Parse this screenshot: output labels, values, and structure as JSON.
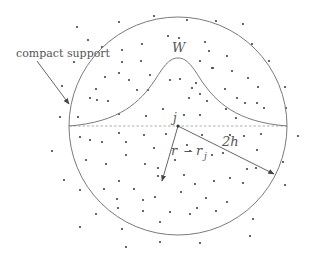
{
  "figure": {
    "width": 310,
    "height": 263,
    "colors": {
      "background": "#ffffff",
      "circle": "#7a7a7a",
      "curve": "#7a7a7a",
      "dashed_line": "#9a9a9a",
      "arrow": "#555555",
      "dot": "#444444",
      "text": "#555555"
    },
    "labels": {
      "compact_support": "compact support",
      "kernel": "W",
      "particle": "j",
      "radius": "2h",
      "distance_r": "r",
      "distance_minus": "−",
      "distance_rj": "r",
      "distance_rj_sub": "j"
    },
    "circle": {
      "cx": 178,
      "cy": 126,
      "r": 109
    },
    "kernel_peak": {
      "x": 178,
      "y": 58
    },
    "arrows": {
      "compact_support": {
        "x1": 37,
        "y1": 61,
        "x2": 69,
        "y2": 104
      },
      "radius_2h": {
        "x1": 178,
        "y1": 126,
        "x2": 274,
        "y2": 174
      },
      "r_minus_rj": {
        "x1": 178,
        "y1": 126,
        "x2": 162,
        "y2": 181
      }
    },
    "particles": [
      [
        77,
        27
      ],
      [
        119,
        22
      ],
      [
        154,
        16
      ],
      [
        102,
        47
      ],
      [
        88,
        40
      ],
      [
        122,
        50
      ],
      [
        142,
        44
      ],
      [
        168,
        36
      ],
      [
        122,
        62
      ],
      [
        141,
        61
      ],
      [
        74,
        62
      ],
      [
        187,
        20
      ],
      [
        216,
        21
      ],
      [
        243,
        24
      ],
      [
        252,
        44
      ],
      [
        269,
        61
      ],
      [
        179,
        38
      ],
      [
        205,
        42
      ],
      [
        209,
        51
      ],
      [
        227,
        56
      ],
      [
        200,
        61
      ],
      [
        213,
        68
      ],
      [
        62,
        86
      ],
      [
        90,
        98
      ],
      [
        105,
        77
      ],
      [
        119,
        73
      ],
      [
        129,
        80
      ],
      [
        150,
        75
      ],
      [
        180,
        79
      ],
      [
        60,
        117
      ],
      [
        78,
        117
      ],
      [
        96,
        89
      ],
      [
        97,
        100
      ],
      [
        108,
        101
      ],
      [
        137,
        90
      ],
      [
        148,
        90
      ],
      [
        170,
        80
      ],
      [
        196,
        83
      ],
      [
        119,
        114
      ],
      [
        146,
        116
      ],
      [
        163,
        109
      ],
      [
        212,
        68
      ],
      [
        232,
        71
      ],
      [
        248,
        78
      ],
      [
        192,
        88
      ],
      [
        200,
        94
      ],
      [
        207,
        101
      ],
      [
        225,
        89
      ],
      [
        237,
        98
      ],
      [
        258,
        87
      ],
      [
        245,
        103
      ],
      [
        257,
        103
      ],
      [
        264,
        108
      ],
      [
        189,
        98
      ],
      [
        226,
        109
      ],
      [
        236,
        118
      ],
      [
        184,
        115
      ],
      [
        200,
        115
      ],
      [
        285,
        87
      ],
      [
        286,
        108
      ],
      [
        52,
        151
      ],
      [
        80,
        137
      ],
      [
        90,
        140
      ],
      [
        102,
        142
      ],
      [
        119,
        133
      ],
      [
        144,
        135
      ],
      [
        166,
        134
      ],
      [
        126,
        142
      ],
      [
        154,
        148
      ],
      [
        86,
        160
      ],
      [
        106,
        164
      ],
      [
        126,
        155
      ],
      [
        145,
        164
      ],
      [
        175,
        160
      ],
      [
        158,
        168
      ],
      [
        158,
        176
      ],
      [
        119,
        181
      ],
      [
        104,
        189
      ],
      [
        134,
        189
      ],
      [
        80,
        190
      ],
      [
        64,
        180
      ],
      [
        155,
        197
      ],
      [
        181,
        192
      ],
      [
        202,
        135
      ],
      [
        230,
        135
      ],
      [
        244,
        136
      ],
      [
        261,
        134
      ],
      [
        298,
        136
      ],
      [
        187,
        145
      ],
      [
        190,
        151
      ],
      [
        212,
        155
      ],
      [
        223,
        153
      ],
      [
        257,
        150
      ],
      [
        247,
        169
      ],
      [
        256,
        168
      ],
      [
        184,
        175
      ],
      [
        195,
        184
      ],
      [
        214,
        181
      ],
      [
        230,
        178
      ],
      [
        243,
        183
      ],
      [
        283,
        162
      ],
      [
        285,
        185
      ],
      [
        117,
        199
      ],
      [
        143,
        200
      ],
      [
        206,
        198
      ],
      [
        227,
        202
      ],
      [
        118,
        208
      ],
      [
        143,
        211
      ],
      [
        170,
        212
      ],
      [
        190,
        214
      ],
      [
        197,
        208
      ],
      [
        216,
        211
      ],
      [
        96,
        214
      ],
      [
        80,
        227
      ],
      [
        122,
        229
      ],
      [
        160,
        222
      ],
      [
        253,
        219
      ],
      [
        250,
        236
      ],
      [
        126,
        247
      ],
      [
        160,
        242
      ],
      [
        200,
        243
      ]
    ]
  }
}
